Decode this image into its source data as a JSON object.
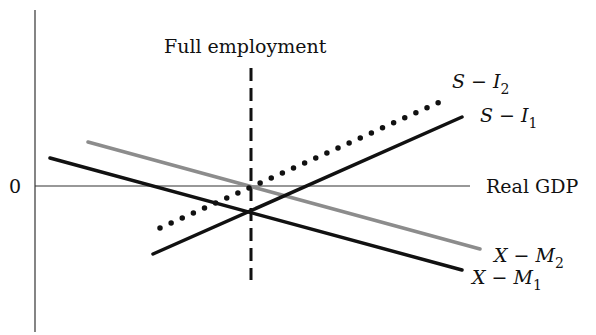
{
  "diagram": {
    "zero_label": "0",
    "x_axis_label": "Real GDP",
    "vertical_marker_label": "Full employment",
    "lines": [
      {
        "id": "s-i-2",
        "label_main": "S − I",
        "label_sub": "2",
        "style": "dotted",
        "color": "#111111"
      },
      {
        "id": "s-i-1",
        "label_main": "S − I",
        "label_sub": "1",
        "style": "solid",
        "color": "#111111"
      },
      {
        "id": "x-m-2",
        "label_main": "X − M",
        "label_sub": "2",
        "style": "solid",
        "color": "#8c8c8c"
      },
      {
        "id": "x-m-1",
        "label_main": "X − M",
        "label_sub": "1",
        "style": "solid",
        "color": "#111111"
      }
    ]
  }
}
